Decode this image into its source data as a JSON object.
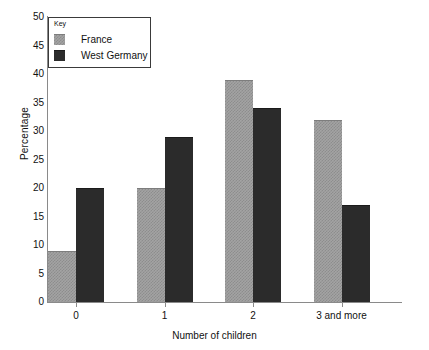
{
  "chart_data": {
    "type": "bar",
    "title": "",
    "xlabel": "Number of children",
    "ylabel": "Percentage",
    "categories": [
      "0",
      "1",
      "2",
      "3 and more"
    ],
    "series": [
      {
        "name": "France",
        "color": "#a3a3a3",
        "values": [
          9,
          20,
          39,
          32
        ]
      },
      {
        "name": "West Germany",
        "color": "#2b2b2b",
        "values": [
          20,
          29,
          34,
          17
        ]
      }
    ],
    "ylim": [
      0,
      50
    ],
    "ytick_step": 5,
    "ytick_labels": [
      "0",
      "5",
      "10",
      "15",
      "20",
      "25",
      "30",
      "35",
      "40",
      "45",
      "50"
    ],
    "grid": false,
    "legend_position": "top-left",
    "legend_title": "Key"
  }
}
